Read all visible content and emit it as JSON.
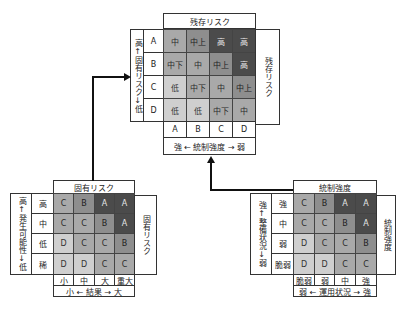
{
  "residual": {
    "title": "残存リスク",
    "side_label": "残存リスク",
    "row_axis_label": "高↑固有リスク↓低",
    "rows": [
      "A",
      "B",
      "C",
      "D"
    ],
    "cols": [
      "A",
      "B",
      "C",
      "D"
    ],
    "col_axis_label": "強 ← 統制強度 → 弱",
    "cells": [
      [
        "中",
        "中上",
        "高",
        "高"
      ],
      [
        "中下",
        "中",
        "中上",
        "高"
      ],
      [
        "低",
        "中下",
        "中",
        "中上"
      ],
      [
        "低",
        "低",
        "中下",
        "中"
      ]
    ],
    "shades": [
      [
        2,
        3,
        4,
        4
      ],
      [
        2,
        2,
        3,
        4
      ],
      [
        1,
        2,
        2,
        3
      ],
      [
        1,
        1,
        2,
        2
      ]
    ]
  },
  "inherent": {
    "title": "固有リスク",
    "side_label": "固有リスク",
    "row_axis_label": "高↑発生可能性↓低",
    "rows": [
      "高",
      "中",
      "低",
      "稀"
    ],
    "cols": [
      "小",
      "中",
      "大",
      "重大"
    ],
    "col_axis_label": "小 ← 結果 → 大",
    "cells": [
      [
        "C",
        "B",
        "A",
        "A"
      ],
      [
        "C",
        "C",
        "B",
        "A"
      ],
      [
        "D",
        "C",
        "C",
        "B"
      ],
      [
        "D",
        "D",
        "C",
        "C"
      ]
    ],
    "shades": [
      [
        2,
        3,
        4,
        4
      ],
      [
        2,
        2,
        3,
        4
      ],
      [
        1,
        2,
        2,
        3
      ],
      [
        1,
        1,
        2,
        2
      ]
    ]
  },
  "control": {
    "title": "統制強度",
    "side_label": "統制強度",
    "row_axis_label": "強↑整備状況↓弱",
    "rows": [
      "強",
      "中",
      "弱",
      "脆弱"
    ],
    "cols": [
      "脆弱",
      "弱",
      "中",
      "強"
    ],
    "col_axis_label": "弱 ← 運用状況 → 強",
    "cells": [
      [
        "C",
        "B",
        "A",
        "A"
      ],
      [
        "C",
        "C",
        "B",
        "A"
      ],
      [
        "D",
        "C",
        "C",
        "B"
      ],
      [
        "D",
        "D",
        "C",
        "C"
      ]
    ],
    "shades": [
      [
        2,
        3,
        4,
        4
      ],
      [
        2,
        2,
        3,
        4
      ],
      [
        1,
        2,
        2,
        3
      ],
      [
        1,
        1,
        2,
        2
      ]
    ]
  }
}
